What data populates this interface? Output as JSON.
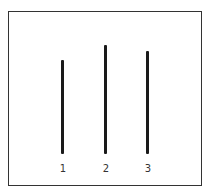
{
  "diagram": {
    "type": "vertical-lines-comparison",
    "lines": [
      {
        "label": "1",
        "x": 62,
        "top": 60,
        "bottom": 154
      },
      {
        "label": "2",
        "x": 105,
        "top": 45,
        "bottom": 154
      },
      {
        "label": "3",
        "x": 147,
        "top": 51,
        "bottom": 154
      }
    ],
    "colors": {
      "line": "#1a1a1a",
      "frame": "#333333",
      "background": "#ffffff"
    }
  }
}
